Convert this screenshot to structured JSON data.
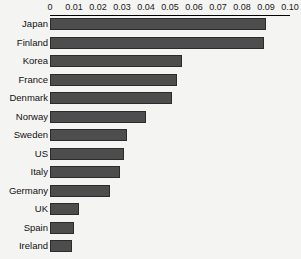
{
  "chart_data": {
    "type": "bar",
    "orientation": "horizontal",
    "title": "",
    "subtitle": "",
    "xlabel": "",
    "ylabel": "",
    "xlim": [
      0,
      0.1
    ],
    "grid": false,
    "legend": null,
    "axis_position": "top",
    "tick_labels": [
      "0",
      "0.01",
      "0.02",
      "0.03",
      "0.04",
      "0.05",
      "0.06",
      "0.07",
      "0.08",
      "0.09",
      "0.10"
    ],
    "ticks": [
      0,
      0.01,
      0.02,
      0.03,
      0.04,
      0.05,
      0.06,
      0.07,
      0.08,
      0.09,
      0.1
    ],
    "categories": [
      "Japan",
      "Finland",
      "Korea",
      "France",
      "Denmark",
      "Norway",
      "Sweden",
      "US",
      "Italy",
      "Germany",
      "UK",
      "Spain",
      "Ireland"
    ],
    "values": [
      0.09,
      0.089,
      0.055,
      0.053,
      0.051,
      0.04,
      0.032,
      0.031,
      0.029,
      0.025,
      0.012,
      0.01,
      0.009
    ],
    "series": [
      {
        "name": "",
        "values": [
          0.09,
          0.089,
          0.055,
          0.053,
          0.051,
          0.04,
          0.032,
          0.031,
          0.029,
          0.025,
          0.012,
          0.01,
          0.009
        ]
      }
    ]
  },
  "style": {
    "bar_fill": "#4d4d4d",
    "bar_edge": "#2b2b2b",
    "background": "#f4f4f2",
    "axis_color": "#000000",
    "text_color": "#111111"
  }
}
